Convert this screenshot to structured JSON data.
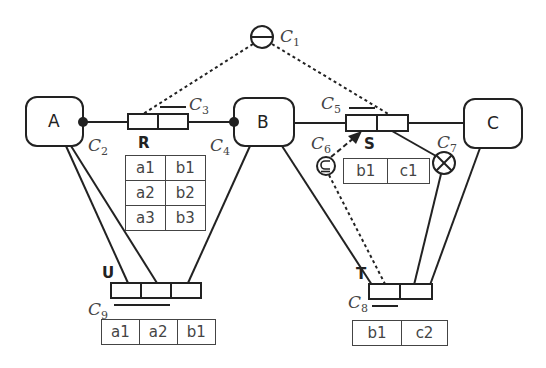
{
  "diagram": {
    "entities": [
      {
        "id": "A",
        "label": "A"
      },
      {
        "id": "B",
        "label": "B"
      },
      {
        "id": "C",
        "label": "C"
      }
    ],
    "relations": [
      {
        "id": "R",
        "label": "R",
        "population": [
          [
            "a1",
            "b1"
          ],
          [
            "a2",
            "b2"
          ],
          [
            "a3",
            "b3"
          ]
        ]
      },
      {
        "id": "S",
        "label": "S",
        "population": [
          [
            "b1",
            "c1"
          ]
        ]
      },
      {
        "id": "U",
        "label": "U",
        "population": [
          [
            "a1",
            "a2",
            "b1"
          ]
        ]
      },
      {
        "id": "T",
        "label": "T",
        "population": [
          [
            "b1",
            "c2"
          ]
        ]
      }
    ],
    "constraints": [
      {
        "id": "C1",
        "base": "C",
        "sub": "1",
        "symbol": "exclusion",
        "glyph": "⊖"
      },
      {
        "id": "C2",
        "base": "C",
        "sub": "2",
        "symbol": "mandatory-dot"
      },
      {
        "id": "C3",
        "base": "C",
        "sub": "3",
        "symbol": "uniqueness-bar"
      },
      {
        "id": "C4",
        "base": "C",
        "sub": "4",
        "symbol": "mandatory-dot"
      },
      {
        "id": "C5",
        "base": "C",
        "sub": "5",
        "symbol": "uniqueness-bar"
      },
      {
        "id": "C6",
        "base": "C",
        "sub": "6",
        "symbol": "subset",
        "glyph": "⊆"
      },
      {
        "id": "C7",
        "base": "C",
        "sub": "7",
        "symbol": "exclusive-or",
        "glyph": "⊗"
      },
      {
        "id": "C8",
        "base": "C",
        "sub": "8",
        "symbol": "uniqueness-bar"
      },
      {
        "id": "C9",
        "base": "C",
        "sub": "9",
        "symbol": "uniqueness-bar"
      }
    ]
  },
  "colors": {
    "stroke": "#222222",
    "text": "#444444"
  }
}
